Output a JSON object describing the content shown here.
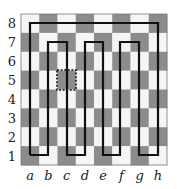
{
  "diagram": {
    "type": "chessboard-path",
    "board": {
      "x": 21,
      "y": 14,
      "width": 146,
      "height": 151,
      "files": [
        "a",
        "b",
        "c",
        "d",
        "e",
        "f",
        "g",
        "h"
      ],
      "ranks": [
        "8",
        "7",
        "6",
        "5",
        "4",
        "3",
        "2",
        "1"
      ],
      "colors": {
        "light": "#f5f5f5",
        "dark": "#8c8c8c",
        "border": "#777777"
      }
    },
    "path": {
      "color": "#111111",
      "width": 2.2,
      "points": [
        [
          30,
          155
        ],
        [
          30,
          23
        ],
        [
          158,
          23
        ],
        [
          158,
          155
        ],
        [
          139,
          155
        ],
        [
          139,
          42
        ],
        [
          120,
          42
        ],
        [
          120,
          155
        ],
        [
          103,
          155
        ],
        [
          103,
          42
        ],
        [
          85,
          42
        ],
        [
          85,
          155
        ],
        [
          67,
          155
        ],
        [
          67,
          42
        ],
        [
          48,
          42
        ],
        [
          48,
          155
        ],
        [
          30,
          155
        ]
      ]
    },
    "highlight": {
      "square": "c5",
      "style": "dashed",
      "x": 57,
      "y": 70,
      "width": 19,
      "height": 20,
      "color": "#111111"
    }
  }
}
